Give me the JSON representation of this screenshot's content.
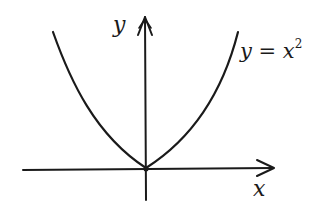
{
  "diagram": {
    "axes": {
      "x_label": "x",
      "y_label": "y"
    },
    "curve": {
      "equation_base": "y = x",
      "equation_exponent": "2"
    },
    "colors": {
      "ink": "#1a1a1a",
      "background": "#ffffff"
    }
  }
}
